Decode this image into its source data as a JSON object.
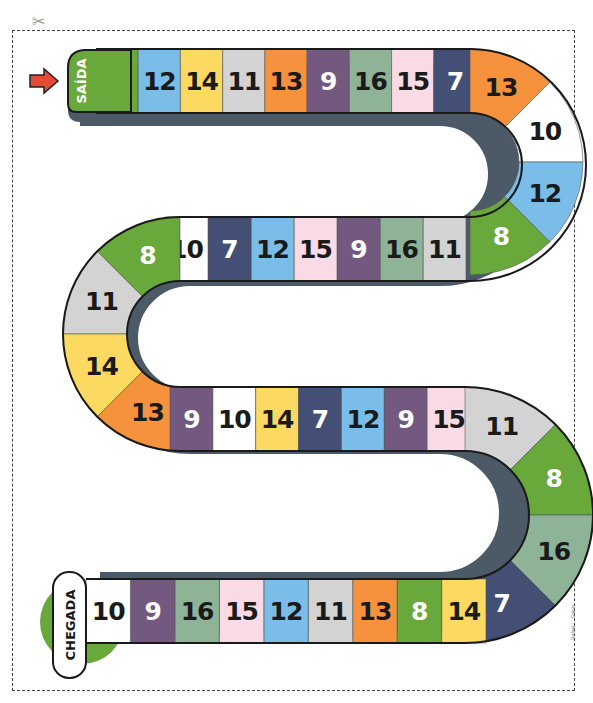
{
  "board": {
    "start_label": "SAÍDA",
    "finish_label": "CHEGADA",
    "credit": "Rafael L. Gaion",
    "start_arrow": "right-arrow-icon",
    "scissors": "scissors-icon"
  },
  "colors": {
    "green": "#69a83a",
    "blue": "#7bbde9",
    "yellow": "#fcd961",
    "gray": "#d3d3d3",
    "orange": "#f6923d",
    "purple": "#73597f",
    "sage": "#8eb397",
    "pink": "#fadbe5",
    "navy": "#434f74",
    "white": "#ffffff",
    "shadow": "#4b5a66",
    "arrow": "#e44b35"
  },
  "spaces": [
    {
      "n": "8",
      "c": "green"
    },
    {
      "n": "12",
      "c": "blue"
    },
    {
      "n": "14",
      "c": "yellow"
    },
    {
      "n": "11",
      "c": "gray"
    },
    {
      "n": "13",
      "c": "orange"
    },
    {
      "n": "9",
      "c": "purple"
    },
    {
      "n": "16",
      "c": "sage"
    },
    {
      "n": "15",
      "c": "pink"
    },
    {
      "n": "7",
      "c": "navy"
    },
    {
      "n": "13",
      "c": "orange"
    },
    {
      "n": "10",
      "c": "white"
    },
    {
      "n": "12",
      "c": "blue"
    },
    {
      "n": "8",
      "c": "green"
    },
    {
      "n": "11",
      "c": "gray"
    },
    {
      "n": "16",
      "c": "sage"
    },
    {
      "n": "9",
      "c": "purple"
    },
    {
      "n": "15",
      "c": "pink"
    },
    {
      "n": "12",
      "c": "blue"
    },
    {
      "n": "7",
      "c": "navy"
    },
    {
      "n": "10",
      "c": "white"
    },
    {
      "n": "8",
      "c": "green"
    },
    {
      "n": "11",
      "c": "gray"
    },
    {
      "n": "14",
      "c": "yellow"
    },
    {
      "n": "13",
      "c": "orange"
    },
    {
      "n": "9",
      "c": "purple"
    },
    {
      "n": "10",
      "c": "white"
    },
    {
      "n": "14",
      "c": "yellow"
    },
    {
      "n": "7",
      "c": "navy"
    },
    {
      "n": "12",
      "c": "blue"
    },
    {
      "n": "9",
      "c": "purple"
    },
    {
      "n": "15",
      "c": "pink"
    },
    {
      "n": "11",
      "c": "gray"
    },
    {
      "n": "8",
      "c": "green"
    },
    {
      "n": "16",
      "c": "sage"
    },
    {
      "n": "7",
      "c": "navy"
    },
    {
      "n": "14",
      "c": "yellow"
    },
    {
      "n": "8",
      "c": "green"
    },
    {
      "n": "13",
      "c": "orange"
    },
    {
      "n": "11",
      "c": "gray"
    },
    {
      "n": "12",
      "c": "blue"
    },
    {
      "n": "15",
      "c": "pink"
    },
    {
      "n": "16",
      "c": "sage"
    },
    {
      "n": "9",
      "c": "purple"
    },
    {
      "n": "10",
      "c": "white"
    }
  ]
}
